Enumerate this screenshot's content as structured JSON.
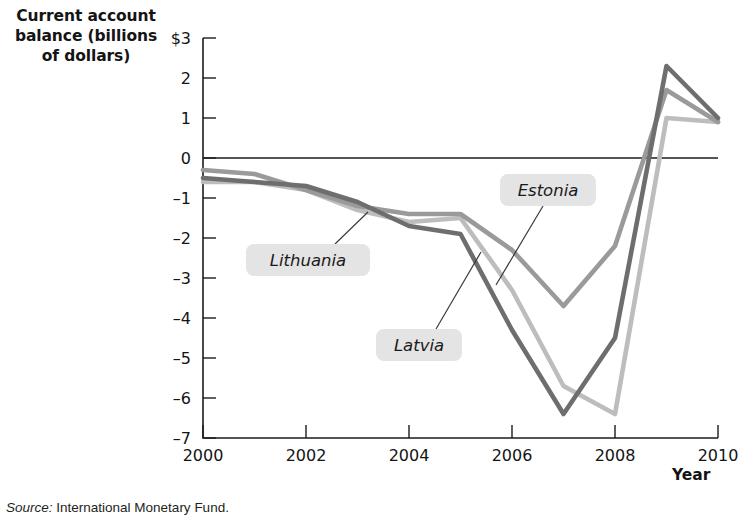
{
  "figure": {
    "y_axis_title": "Current account balance (billions of dollars)",
    "x_axis_title": "Year",
    "source_prefix": "Source:",
    "source_text": "International Monetary Fund."
  },
  "chart_data": {
    "type": "line",
    "title": "",
    "xlabel": "Year",
    "ylabel": "Current account balance (billions of dollars)",
    "xlim": [
      2000,
      2010
    ],
    "ylim": [
      -7,
      3
    ],
    "xticks": [
      2000,
      2002,
      2004,
      2006,
      2008,
      2010
    ],
    "xtick_labels": [
      "2000",
      "2002",
      "2004",
      "2006",
      "2008",
      "2010"
    ],
    "yticks": [
      3,
      2,
      1,
      0,
      -1,
      -2,
      -3,
      -4,
      -5,
      -6,
      -7
    ],
    "ytick_labels": [
      "$3",
      "2",
      "1",
      "0",
      "-1",
      "-2",
      "-3",
      "-4",
      "-5",
      "-6",
      "-7"
    ],
    "grid": false,
    "legend": "inline-annotations",
    "x": [
      2000,
      2001,
      2002,
      2003,
      2004,
      2005,
      2006,
      2007,
      2008,
      2009,
      2010
    ],
    "series": [
      {
        "name": "Estonia",
        "color": "#9a9a9a",
        "values": [
          -0.3,
          -0.4,
          -0.8,
          -1.2,
          -1.4,
          -1.4,
          -2.3,
          -3.7,
          -2.2,
          1.7,
          0.9
        ]
      },
      {
        "name": "Latvia",
        "color": "#6e6e6e",
        "values": [
          -0.5,
          -0.6,
          -0.7,
          -1.1,
          -1.7,
          -1.9,
          -4.3,
          -6.4,
          -4.5,
          2.3,
          1.0
        ]
      },
      {
        "name": "Lithuania",
        "color": "#bdbdbd",
        "values": [
          -0.6,
          -0.6,
          -0.8,
          -1.3,
          -1.6,
          -1.5,
          -3.3,
          -5.7,
          -6.4,
          1.0,
          0.9
        ]
      }
    ],
    "annotations": [
      {
        "label": "Lithuania",
        "box_x": 246,
        "box_y": 244,
        "box_w": 124,
        "box_h": 32,
        "text_x": 308,
        "text_y": 266,
        "leader": "M 335 244 L 368 212"
      },
      {
        "label": "Latvia",
        "box_x": 376,
        "box_y": 329,
        "box_w": 86,
        "box_h": 32,
        "text_x": 419,
        "text_y": 351,
        "leader": "M 436 329 L 481 252"
      },
      {
        "label": "Estonia",
        "box_x": 500,
        "box_y": 174,
        "box_w": 96,
        "box_h": 32,
        "text_x": 548,
        "text_y": 196,
        "leader": "M 543 206 L 496 285"
      }
    ]
  }
}
